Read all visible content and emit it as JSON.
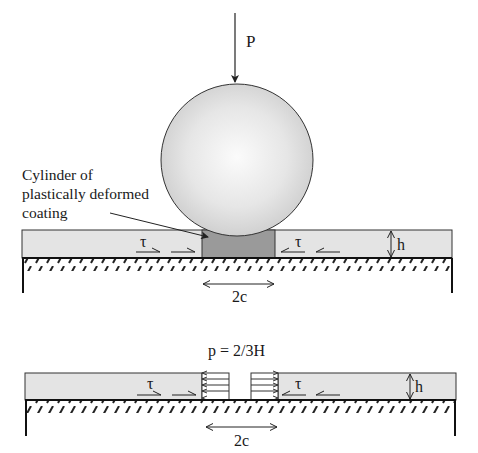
{
  "top_figure": {
    "load_label": "P",
    "annotation_lines": [
      "Cylinder of",
      "plastically deformed",
      "coating"
    ],
    "shear_label_left": "τ",
    "shear_label_right": "τ",
    "thickness_label": "h",
    "contact_width_label": "2c"
  },
  "bottom_figure": {
    "pressure_label": "p = 2/3H",
    "shear_label_left": "τ",
    "shear_label_right": "τ",
    "thickness_label": "h",
    "contact_width_label": "2c"
  },
  "colors": {
    "coating_fill": "#e4e4e4",
    "plastic_zone_fill": "#9a9a9a",
    "sphere_light": "#f7f7f7",
    "sphere_dark": "#cfcfcf",
    "line": "#222222"
  }
}
